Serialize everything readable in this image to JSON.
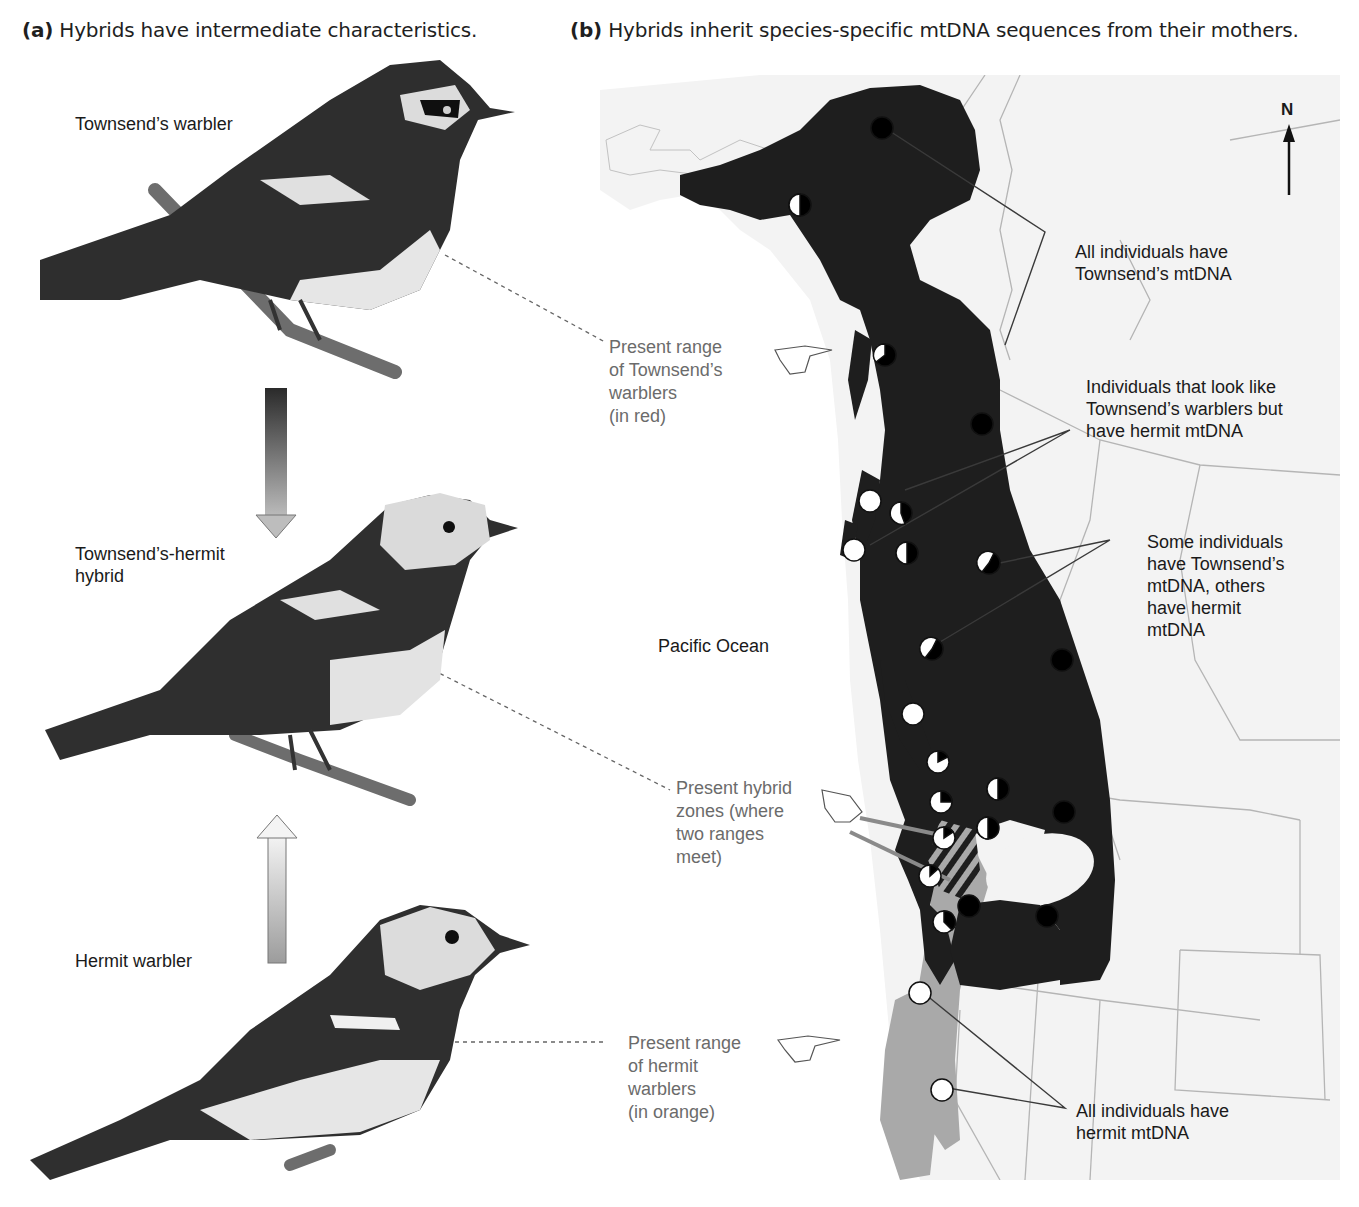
{
  "panel_a": {
    "letter": "(a)",
    "title": "Hybrids have intermediate characteristics.",
    "birds": [
      {
        "label": "Townsend’s warbler"
      },
      {
        "label_line1": "Townsend’s-hermit",
        "label_line2": "hybrid"
      },
      {
        "label": "Hermit warbler"
      }
    ]
  },
  "panel_b": {
    "letter": "(b)",
    "title": "Hybrids inherit species-specific mtDNA sequences from their mothers.",
    "compass": "N",
    "ocean_label": "Pacific Ocean",
    "range_labels": {
      "townsend": [
        "Present range",
        "of Townsend’s",
        "warblers",
        "(in red)"
      ],
      "hybrid": [
        "Present hybrid",
        "zones (where",
        "two ranges",
        "meet)"
      ],
      "hermit": [
        "Present range",
        "of hermit",
        "warblers",
        "(in orange)"
      ]
    },
    "callouts": {
      "all_townsend": [
        "All individuals have",
        "Townsend’s mtDNA"
      ],
      "look_townsend": [
        "Individuals that look like",
        "Townsend’s warblers but",
        "have hermit mtDNA"
      ],
      "mixed": [
        "Some individuals",
        "have Townsend’s",
        "mtDNA, others",
        "have hermit",
        "mtDNA"
      ],
      "all_hermit": [
        "All individuals have",
        "hermit mtDNA"
      ]
    },
    "legend_colors": {
      "townsend_range": "#1e1e1e",
      "hermit_range": "#a9a9a9",
      "land": "#f2f2f2",
      "ocean": "#ffffff"
    }
  }
}
